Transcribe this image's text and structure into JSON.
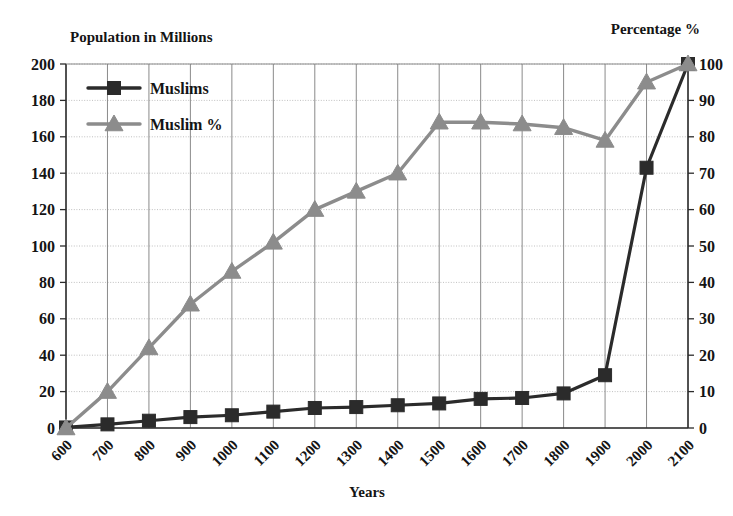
{
  "chart_data": {
    "type": "line",
    "title": "",
    "left_axis_title": "Population in Millions",
    "right_axis_title": "Percentage %",
    "xlabel": "Years",
    "ylabel": "Population in Millions",
    "y2label": "Percentage %",
    "grid": true,
    "legend_position": "top-left",
    "ylim": [
      0,
      200
    ],
    "y2lim": [
      0,
      100
    ],
    "yticks": [
      0,
      20,
      40,
      60,
      80,
      100,
      120,
      140,
      160,
      180,
      200
    ],
    "y2ticks": [
      0,
      10,
      20,
      30,
      40,
      50,
      60,
      70,
      80,
      90,
      100
    ],
    "categories": [
      "600",
      "700",
      "800",
      "900",
      "1000",
      "1100",
      "1200",
      "1300",
      "1400",
      "1500",
      "1600",
      "1700",
      "1800",
      "1900",
      "2000",
      "2100"
    ],
    "xtick_labels": [
      "600",
      "700",
      "800",
      "900",
      "1000",
      "1100",
      "1200",
      "1300",
      "1400",
      "1500",
      "1600",
      "1700",
      "1800",
      "1900",
      "2000",
      "2100"
    ],
    "series": [
      {
        "name": "Muslims",
        "axis": "left",
        "color": "#2b2b2b",
        "marker": "square",
        "values": [
          0.3,
          2,
          4,
          6,
          7,
          9,
          11,
          11.5,
          12.5,
          13.5,
          16,
          16.5,
          19,
          29,
          143,
          200
        ]
      },
      {
        "name": "Muslim %",
        "axis": "right",
        "color": "#8c8c8c",
        "marker": "triangle",
        "values": [
          0,
          10,
          22,
          34,
          43,
          51,
          60,
          65,
          70,
          84,
          84,
          83.5,
          82.5,
          79,
          95,
          100
        ]
      }
    ]
  },
  "legend": {
    "items": [
      {
        "label": "Muslims",
        "color": "#2b2b2b",
        "marker": "square"
      },
      {
        "label": "Muslim %",
        "color": "#8c8c8c",
        "marker": "triangle"
      }
    ]
  },
  "labels": {
    "left_axis_title": "Population in Millions",
    "right_axis_title": "Percentage %",
    "x_axis_title": "Years"
  }
}
